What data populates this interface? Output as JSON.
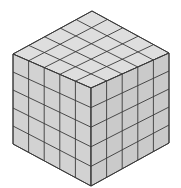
{
  "diagram": {
    "type": "isometric-cube",
    "title": "5×5×5 cube of unit cubes",
    "grid_size": 5,
    "vertices": {
      "top": [
        92,
        11
      ],
      "left": [
        13,
        54
      ],
      "right": [
        169,
        53
      ],
      "front": [
        91,
        88
      ],
      "left_bottom": [
        13,
        144
      ],
      "right_bottom": [
        169,
        143
      ],
      "bottom": [
        91,
        186
      ]
    },
    "colors": {
      "background": "#ffffff",
      "top_face": "#dedede",
      "left_face": "#d2d2d2",
      "right_face": "#cacaca",
      "grid_line": "#3a3a3a",
      "highlight": "#f2f2f2"
    }
  }
}
